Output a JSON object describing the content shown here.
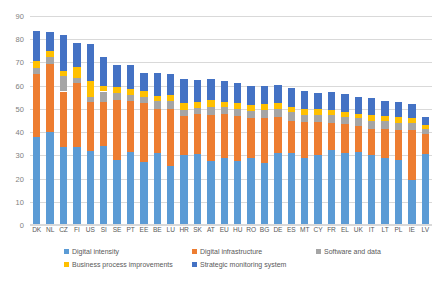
{
  "chart_data": {
    "type": "bar",
    "stacked": true,
    "title": "",
    "xlabel": "",
    "ylabel": "",
    "ylim": [
      0,
      90
    ],
    "ytick_step": 10,
    "yticks": [
      0,
      10,
      20,
      30,
      40,
      50,
      60,
      70,
      80,
      90
    ],
    "grid": true,
    "legend_position": "bottom",
    "categories": [
      "DK",
      "NL",
      "CZ",
      "FI",
      "US",
      "SI",
      "SE",
      "PT",
      "EE",
      "BE",
      "LU",
      "HR",
      "SK",
      "AT",
      "EU",
      "HU",
      "RO",
      "BG",
      "DE",
      "ES",
      "MT",
      "CY",
      "FR",
      "EL",
      "UK",
      "IT",
      "LT",
      "PL",
      "IE",
      "LV"
    ],
    "series": [
      {
        "name": "Digital intensity",
        "color": "#5b9bd5",
        "values": [
          38.0,
          40.0,
          33.5,
          33.5,
          32.0,
          34.0,
          28.0,
          31.5,
          27.0,
          31.0,
          25.5,
          30.0,
          30.5,
          27.5,
          29.0,
          27.5,
          29.0,
          26.5,
          31.0,
          31.0,
          29.0,
          30.0,
          32.5,
          31.0,
          31.5,
          30.0,
          29.0,
          28.0,
          19.5,
          30.5
        ]
      },
      {
        "name": "Digital infrastructure",
        "color": "#ed7d31",
        "values": [
          27.0,
          29.5,
          24.0,
          27.5,
          21.0,
          19.0,
          26.0,
          22.0,
          25.5,
          19.0,
          24.5,
          17.0,
          17.5,
          20.0,
          19.0,
          19.5,
          17.0,
          19.5,
          15.5,
          14.0,
          15.5,
          14.5,
          11.5,
          12.5,
          11.0,
          11.5,
          12.5,
          13.0,
          21.5,
          8.5
        ]
      },
      {
        "name": "Software and data",
        "color": "#a5a5a5",
        "values": [
          2.5,
          3.0,
          6.5,
          2.5,
          2.0,
          4.5,
          3.0,
          2.5,
          2.5,
          3.5,
          3.5,
          2.5,
          2.5,
          3.5,
          3.0,
          3.0,
          3.0,
          3.5,
          3.5,
          3.5,
          3.0,
          3.0,
          3.5,
          3.0,
          3.5,
          3.5,
          3.5,
          3.0,
          3.0,
          2.5
        ]
      },
      {
        "name": "Business process improvements",
        "color": "#ffc000",
        "values": [
          3.0,
          2.5,
          2.5,
          4.5,
          7.0,
          2.5,
          2.5,
          2.5,
          2.5,
          2.0,
          2.5,
          3.0,
          2.5,
          3.0,
          2.0,
          2.5,
          2.5,
          2.5,
          2.5,
          2.5,
          2.5,
          2.5,
          2.0,
          2.0,
          2.0,
          2.5,
          2.0,
          2.5,
          2.0,
          1.5
        ]
      },
      {
        "name": "Strategic monitoring system",
        "color": "#4472c4",
        "values": [
          13.0,
          8.0,
          15.5,
          10.5,
          16.0,
          12.5,
          9.5,
          10.5,
          8.0,
          10.0,
          9.0,
          10.5,
          9.5,
          9.0,
          9.0,
          8.5,
          8.5,
          8.0,
          8.0,
          8.0,
          7.5,
          7.0,
          8.0,
          8.0,
          7.0,
          7.0,
          6.5,
          6.5,
          6.0,
          3.5
        ]
      }
    ],
    "totals": [
      83.5,
      83.0,
      82.0,
      78.5,
      78.0,
      72.5,
      69.0,
      69.0,
      65.5,
      65.5,
      65.0,
      63.0,
      62.5,
      63.0,
      62.0,
      61.0,
      60.0,
      60.0,
      60.5,
      59.0,
      57.5,
      57.0,
      57.5,
      56.5,
      55.0,
      54.5,
      53.5,
      53.0,
      52.0,
      46.5
    ]
  },
  "legend": {
    "items": [
      {
        "label": "Digital intensity",
        "color": "#5b9bd5"
      },
      {
        "label": "Digital infrastructure",
        "color": "#ed7d31"
      },
      {
        "label": "Software and data",
        "color": "#a5a5a5"
      },
      {
        "label": "Business process improvements",
        "color": "#ffc000"
      },
      {
        "label": "Strategic monitoring system",
        "color": "#4472c4"
      }
    ]
  }
}
